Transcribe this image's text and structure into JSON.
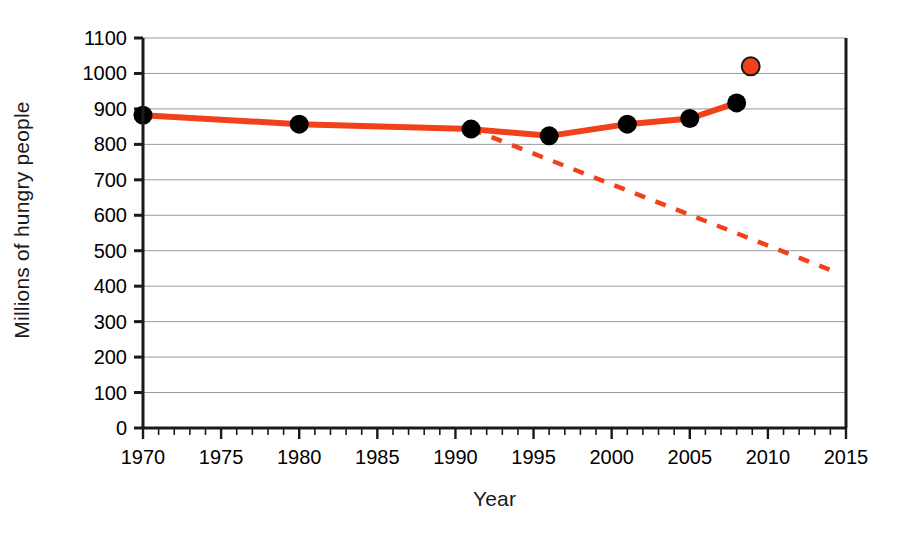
{
  "chart_data": {
    "type": "line",
    "title": "",
    "xlabel": "Year",
    "ylabel": "Millions of hungry people",
    "xlim": [
      1970,
      2015
    ],
    "ylim": [
      0,
      1100
    ],
    "grid": true,
    "legend": "none",
    "x_ticks": [
      1970,
      1975,
      1980,
      1985,
      1990,
      1995,
      2000,
      2005,
      2010,
      2015
    ],
    "x_tick_labels": [
      "1970",
      "1975",
      "1980",
      "1985",
      "1990",
      "1995",
      "2000",
      "2005",
      "2010",
      "2015"
    ],
    "x_minor_tick_step": 1,
    "y_ticks": [
      0,
      100,
      200,
      300,
      400,
      500,
      600,
      700,
      800,
      900,
      1000,
      1100
    ],
    "y_tick_labels": [
      "0",
      "100",
      "200",
      "300",
      "400",
      "500",
      "600",
      "700",
      "800",
      "900",
      "1000",
      "1100"
    ],
    "series": [
      {
        "name": "Observed hungry people",
        "style": "solid",
        "color": "#F2401B",
        "marker": "filled-circle",
        "marker_color": "#000000",
        "x": [
          1970,
          1980,
          1991,
          1996,
          2001,
          2005,
          2008
        ],
        "values": [
          882,
          857,
          843,
          824,
          857,
          873,
          917
        ]
      },
      {
        "name": "Millennium Development Goal target trajectory",
        "style": "dashed",
        "color": "#F2401B",
        "marker": "none",
        "x": [
          1991,
          2014.5
        ],
        "values": [
          843,
          437
        ]
      },
      {
        "name": "2009 estimate",
        "style": "none",
        "color": "#F2401B",
        "marker": "open-circle",
        "marker_edge_color": "#1a1a1a",
        "x": [
          2008.9
        ],
        "values": [
          1020
        ]
      }
    ]
  },
  "axes": {
    "x_title": "Year",
    "y_title": "Millions of hungry people"
  }
}
